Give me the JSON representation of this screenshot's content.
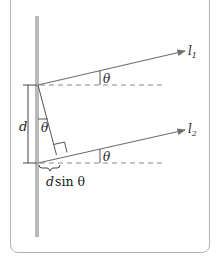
{
  "diagram": {
    "type": "double-slit path difference",
    "colors": {
      "barrier": "#b9b9b9",
      "ray": "#6e6e6e",
      "dashed": "#8a8a8a",
      "text": "#222222",
      "panel_border": "#b4b4b4"
    },
    "labels": {
      "ray1": "l",
      "ray1_sub": "1",
      "ray2": "l",
      "ray2_sub": "2",
      "theta_top": "θ",
      "theta_bottom": "θ",
      "theta_mid": "θ",
      "separation": "d",
      "path_diff_d": "d",
      "path_diff_rest": "sin θ"
    }
  }
}
